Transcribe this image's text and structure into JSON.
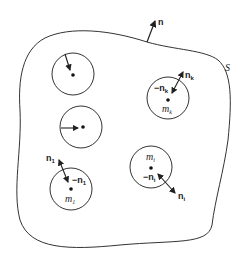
{
  "diagram": {
    "surface_label": "S",
    "outer_normal_label": "n",
    "spheres": [
      {
        "id": "sphere-a",
        "mass_label": "",
        "normal_label": "",
        "inner_normal_label": ""
      },
      {
        "id": "sphere-b",
        "mass_label": "",
        "normal_label": "",
        "inner_normal_label": ""
      },
      {
        "id": "sphere-1",
        "mass_label": "m",
        "mass_sub": "1",
        "normal_label": "n",
        "normal_sub": "1",
        "inner_normal_label": "−n",
        "inner_normal_sub": "1"
      },
      {
        "id": "sphere-k",
        "mass_label": "m",
        "mass_sub": "k",
        "normal_label": "n",
        "normal_sub": "k",
        "inner_normal_label": "−n",
        "inner_normal_sub": "k"
      },
      {
        "id": "sphere-i",
        "mass_label": "m",
        "mass_sub": "i",
        "normal_label": "n",
        "normal_sub": "i",
        "inner_normal_label": "−n",
        "inner_normal_sub": "i"
      }
    ],
    "colors": {
      "stroke": "#333333",
      "background": "#ffffff"
    }
  }
}
